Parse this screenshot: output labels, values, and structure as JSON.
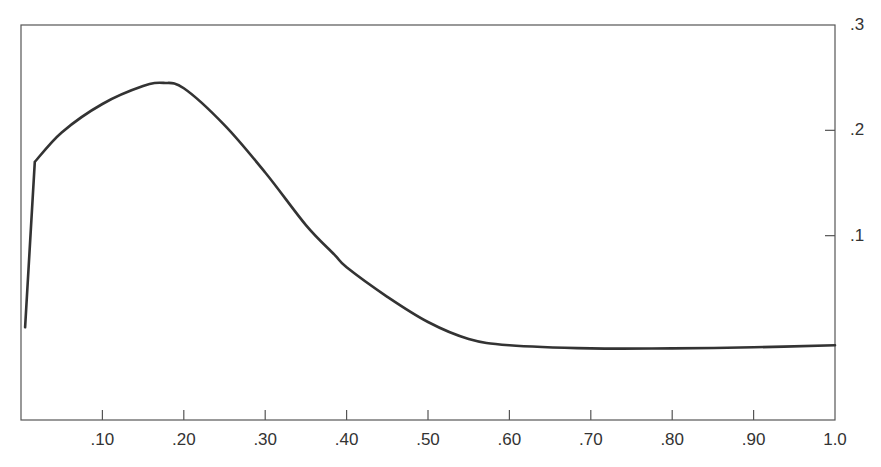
{
  "chart_data": {
    "type": "line",
    "title": "",
    "xlabel": "",
    "ylabel": "",
    "xlim": [
      0,
      1.0
    ],
    "ylim": [
      -0.075,
      0.3
    ],
    "grid": false,
    "legend": null,
    "y_axis_position": "right",
    "x_ticks": [
      {
        "value": 0.1,
        "label": ".10"
      },
      {
        "value": 0.2,
        "label": ".20"
      },
      {
        "value": 0.3,
        "label": ".30"
      },
      {
        "value": 0.4,
        "label": ".40"
      },
      {
        "value": 0.5,
        "label": ".50"
      },
      {
        "value": 0.6,
        "label": ".60"
      },
      {
        "value": 0.7,
        "label": ".70"
      },
      {
        "value": 0.8,
        "label": ".80"
      },
      {
        "value": 0.9,
        "label": ".90"
      },
      {
        "value": 1.0,
        "label": "1.0"
      }
    ],
    "y_ticks": [
      {
        "value": 0.1,
        "label": ".1"
      },
      {
        "value": 0.2,
        "label": ".2"
      },
      {
        "value": 0.3,
        "label": ".3"
      }
    ],
    "series": [
      {
        "name": "curve",
        "color": "#333333",
        "x": [
          0.005,
          0.017,
          0.05,
          0.1,
          0.15,
          0.175,
          0.2,
          0.25,
          0.3,
          0.35,
          0.385,
          0.4,
          0.45,
          0.5,
          0.55,
          0.6,
          0.7,
          0.8,
          0.9,
          1.0
        ],
        "y": [
          0.013,
          0.17,
          0.198,
          0.225,
          0.242,
          0.245,
          0.24,
          0.205,
          0.16,
          0.11,
          0.082,
          0.07,
          0.042,
          0.018,
          0.002,
          -0.004,
          -0.007,
          -0.007,
          -0.006,
          -0.004
        ]
      }
    ]
  }
}
